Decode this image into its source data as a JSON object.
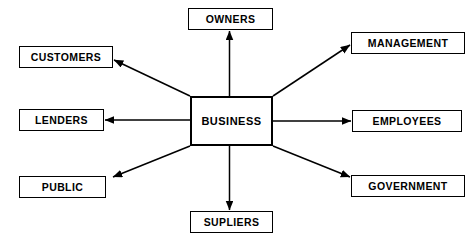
{
  "diagram": {
    "background_color": "#ffffff",
    "line_color": "#000000",
    "box_fill": "#ffffff",
    "center": {
      "label": "BUSINESS",
      "x": 190,
      "y": 96,
      "width": 83,
      "height": 50
    },
    "nodes": [
      {
        "id": "owners",
        "label": "OWNERS",
        "x": 188,
        "y": 8,
        "width": 85,
        "height": 22
      },
      {
        "id": "management",
        "label": "MANAGEMENT",
        "x": 351,
        "y": 32,
        "width": 114,
        "height": 22
      },
      {
        "id": "customers",
        "label": "CUSTOMERS",
        "x": 19,
        "y": 46,
        "width": 94,
        "height": 22
      },
      {
        "id": "lenders",
        "label": "LENDERS",
        "x": 19,
        "y": 109,
        "width": 85,
        "height": 22
      },
      {
        "id": "employees",
        "label": "EMPLOYEES",
        "x": 352,
        "y": 110,
        "width": 110,
        "height": 22
      },
      {
        "id": "public",
        "label": "PUBLIC",
        "x": 19,
        "y": 176,
        "width": 87,
        "height": 22
      },
      {
        "id": "government",
        "label": "GOVERNMENT",
        "x": 351,
        "y": 175,
        "width": 114,
        "height": 22
      },
      {
        "id": "supliers",
        "label": "SUPLIERS",
        "x": 190,
        "y": 211,
        "width": 83,
        "height": 22
      }
    ],
    "edges": [
      {
        "id": "business-to-owners",
        "from": "business",
        "to": "owners",
        "x1": 229.5,
        "y1": 96,
        "x2": 229.5,
        "y2": 31
      },
      {
        "id": "business-to-management",
        "from": "business",
        "to": "management",
        "x1": 273,
        "y1": 96,
        "x2": 350,
        "y2": 45
      },
      {
        "id": "business-to-customers",
        "from": "business",
        "to": "customers",
        "x1": 190,
        "y1": 96,
        "x2": 114,
        "y2": 60
      },
      {
        "id": "business-to-lenders",
        "from": "business",
        "to": "lenders",
        "x1": 190,
        "y1": 120,
        "x2": 105,
        "y2": 120
      },
      {
        "id": "business-to-employees",
        "from": "business",
        "to": "employees",
        "x1": 273,
        "y1": 121,
        "x2": 351,
        "y2": 121
      },
      {
        "id": "business-to-public",
        "from": "business",
        "to": "public",
        "x1": 190,
        "y1": 146,
        "x2": 113,
        "y2": 177
      },
      {
        "id": "business-to-government",
        "from": "business",
        "to": "government",
        "x1": 273,
        "y1": 146,
        "x2": 350,
        "y2": 177
      },
      {
        "id": "business-to-supliers",
        "from": "business",
        "to": "supliers",
        "x1": 229.5,
        "y1": 146,
        "x2": 229.5,
        "y2": 210
      }
    ]
  }
}
